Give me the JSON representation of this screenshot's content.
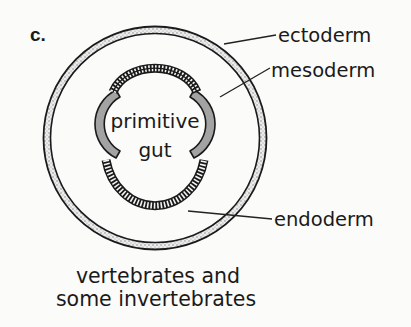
{
  "figure": {
    "panel_label": "c.",
    "title_caption": {
      "line1": "vertebrates and",
      "line2": "some invertebrates"
    },
    "center_label": {
      "line1": "primitive",
      "line2": "gut"
    },
    "layers": [
      {
        "name": "ectoderm",
        "label": "ectoderm",
        "pattern": "stippled ring",
        "color": "#d8d8d8"
      },
      {
        "name": "mesoderm",
        "label": "mesoderm",
        "pattern": "solid grey lobes",
        "color": "#a3a3a3"
      },
      {
        "name": "endoderm",
        "label": "endoderm",
        "pattern": "hatched lining",
        "color": "#1a1a1a"
      }
    ]
  },
  "colors": {
    "background": "#fbfbf9",
    "ink": "#1a1a1a",
    "mesoderm_fill": "#a3a3a3",
    "ectoderm_fill": "#e6e6e6"
  }
}
